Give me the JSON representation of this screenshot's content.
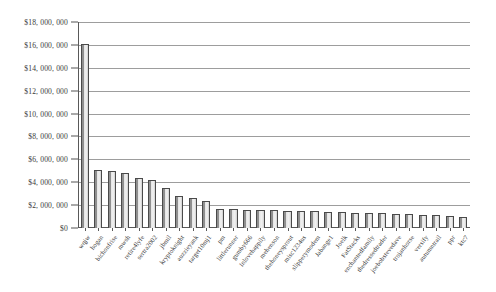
{
  "chart_data": {
    "type": "bar",
    "title": "",
    "subtitle": "",
    "xlabel": "",
    "ylabel": "",
    "ylim": [
      0,
      18000000
    ],
    "grid": true,
    "legend": "none",
    "orientation": "vertical",
    "ytick_labels": [
      "$18, 000, 000",
      "$16, 000, 000",
      "$14, 000, 000",
      "$12, 000, 000",
      "$10, 000, 000",
      "$8, 000, 000",
      "$6, 000, 000",
      "$4, 000, 000",
      "$2, 000, 000",
      "$0"
    ],
    "ytick_values": [
      18000000,
      16000000,
      14000000,
      12000000,
      10000000,
      8000000,
      6000000,
      4000000,
      2000000,
      0
    ],
    "categories": [
      "wqjw",
      "hogan",
      "bichonfrise",
      "mwsh",
      "retire4lyfe",
      "sertra2002",
      "jbmil",
      "kryptoknight",
      "auzzieyank",
      "target10mj1",
      "pm",
      "littlerunner",
      "gumby666",
      "Inlovehappily",
      "mehenson",
      "thehoneysprout",
      "misc1234us",
      "slipperymodem",
      "Jabange1",
      "Joelk",
      "FatStacks",
      "enchantedfamily",
      "thedressedtrader",
      "joebobstevedave",
      "trojanhorse",
      "versify",
      "autumntrail",
      "ppr",
      "ktc7"
    ],
    "values": [
      16100000,
      5050000,
      5000000,
      4800000,
      4350000,
      4200000,
      3500000,
      2800000,
      2650000,
      2400000,
      1700000,
      1650000,
      1600000,
      1600000,
      1550000,
      1500000,
      1450000,
      1450000,
      1400000,
      1400000,
      1350000,
      1350000,
      1300000,
      1250000,
      1200000,
      1150000,
      1100000,
      1050000,
      1000000
    ],
    "bar_count": 29,
    "colors": {
      "bar_fill": "#e8e8e8",
      "bar_edge": "#4a4a4a",
      "gridline": "#9d9d9d",
      "axis": "#555555",
      "text": "#333333",
      "background": "#ffffff"
    }
  }
}
